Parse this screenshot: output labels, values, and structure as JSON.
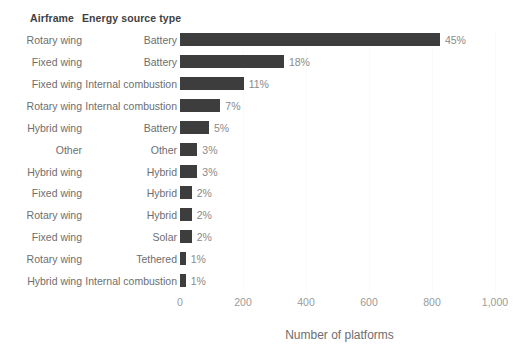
{
  "headers": {
    "airframe": "Airframe",
    "energy": "Energy source type"
  },
  "axis": {
    "x_title": "Number of platforms",
    "ticks": [
      "0",
      "200",
      "400",
      "600",
      "800",
      "1,000"
    ]
  },
  "colors": {
    "bar": "#3d3d3d",
    "label": "#6e6e6e",
    "pct": "#8a8a8a",
    "grid": "#fafafa",
    "background": "#ffffff"
  },
  "chart_data": {
    "type": "bar",
    "orientation": "horizontal",
    "title": "",
    "xlabel": "Number of platforms",
    "ylabel": "",
    "xlim": [
      0,
      1000
    ],
    "xticks": [
      0,
      200,
      400,
      600,
      800,
      1000
    ],
    "xtick_labels": [
      "0",
      "200",
      "400",
      "600",
      "800",
      "1,000"
    ],
    "grid": true,
    "legend": "none",
    "group_headers": [
      "Airframe",
      "Energy source type"
    ],
    "categories": [
      "Rotary wing - Battery",
      "Fixed wing - Battery",
      "Fixed wing - Internal combustion",
      "Rotary wing - Internal combustion",
      "Hybrid wing - Battery",
      "Other - Other",
      "Hybrid wing - Hybrid",
      "Fixed wing - Hybrid",
      "Rotary wing - Hybrid",
      "Fixed wing - Solar",
      "Rotary wing - Tethered",
      "Hybrid wing - Internal combustion"
    ],
    "rows": [
      {
        "airframe": "Rotary wing",
        "energy": "Battery",
        "value": 825,
        "pct": "45%"
      },
      {
        "airframe": "Fixed wing",
        "energy": "Battery",
        "value": 330,
        "pct": "18%"
      },
      {
        "airframe": "Fixed wing",
        "energy": "Internal combustion",
        "value": 202,
        "pct": "11%"
      },
      {
        "airframe": "Rotary wing",
        "energy": "Internal combustion",
        "value": 128,
        "pct": "7%"
      },
      {
        "airframe": "Hybrid wing",
        "energy": "Battery",
        "value": 92,
        "pct": "5%"
      },
      {
        "airframe": "Other",
        "energy": "Other",
        "value": 55,
        "pct": "3%"
      },
      {
        "airframe": "Hybrid wing",
        "energy": "Hybrid",
        "value": 55,
        "pct": "3%"
      },
      {
        "airframe": "Fixed wing",
        "energy": "Hybrid",
        "value": 37,
        "pct": "2%"
      },
      {
        "airframe": "Rotary wing",
        "energy": "Hybrid",
        "value": 37,
        "pct": "2%"
      },
      {
        "airframe": "Fixed wing",
        "energy": "Solar",
        "value": 37,
        "pct": "2%"
      },
      {
        "airframe": "Rotary wing",
        "energy": "Tethered",
        "value": 18,
        "pct": "1%"
      },
      {
        "airframe": "Hybrid wing",
        "energy": "Internal combustion",
        "value": 18,
        "pct": "1%"
      }
    ]
  }
}
